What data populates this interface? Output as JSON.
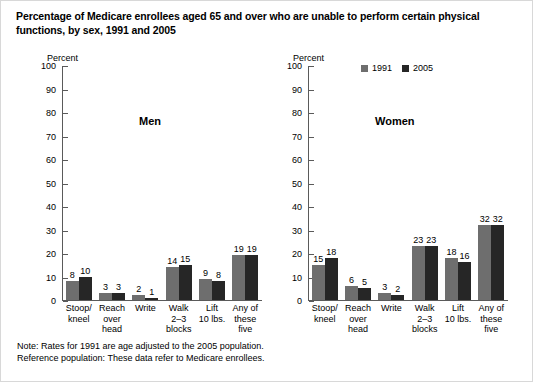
{
  "title": "Percentage of Medicare enrollees aged 65 and over who are unable to perform certain physical functions, by sex, 1991 and 2005",
  "legend": {
    "items": [
      {
        "label": "1991",
        "color": "#6e6e6e"
      },
      {
        "label": "2005",
        "color": "#262626"
      }
    ]
  },
  "footnotes": {
    "note": "Note: Rates for 1991 are age adjusted to the 2005 population.",
    "reference": "Reference population: These data refer to Medicare enrollees."
  },
  "axis": {
    "label": "Percent",
    "ticks": [
      "100",
      "90",
      "80",
      "70",
      "60",
      "50",
      "40",
      "30",
      "20",
      "10",
      "0"
    ]
  },
  "chart_data": {
    "type": "bar",
    "title": "Percentage of Medicare enrollees aged 65 and over who are unable to perform certain physical functions, by sex, 1991 and 2005",
    "xlabel": "",
    "ylabel": "Percent",
    "ylim": [
      0,
      100
    ],
    "ytick_step": 10,
    "grid": false,
    "legend_position": "top-right",
    "categories": [
      "Stoop/\nkneel",
      "Reach\nover\nhead",
      "Write",
      "Walk\n2–3\nblocks",
      "Lift\n10 lbs.",
      "Any of\nthese\nfive"
    ],
    "panels": [
      {
        "name": "Men",
        "series": [
          {
            "name": "1991",
            "color": "#6e6e6e",
            "values": [
              8,
              3,
              2,
              14,
              9,
              19
            ]
          },
          {
            "name": "2005",
            "color": "#262626",
            "values": [
              10,
              3,
              1,
              15,
              8,
              19
            ]
          }
        ]
      },
      {
        "name": "Women",
        "series": [
          {
            "name": "1991",
            "color": "#6e6e6e",
            "values": [
              15,
              6,
              3,
              23,
              18,
              32
            ]
          },
          {
            "name": "2005",
            "color": "#262626",
            "values": [
              18,
              5,
              2,
              23,
              16,
              32
            ]
          }
        ]
      }
    ],
    "annotations": [
      "Note: Rates for 1991 are age adjusted to the 2005 population.",
      "Reference population: These data refer to Medicare enrollees."
    ]
  }
}
